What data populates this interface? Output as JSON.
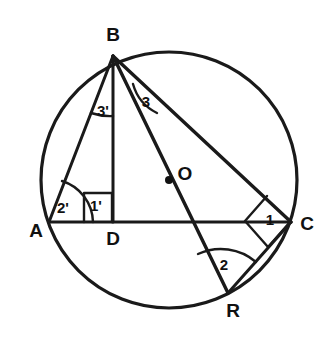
{
  "figure": {
    "type": "circle-geometry-diagram",
    "background_color": "#ffffff",
    "ink_color": "#1a1a1a"
  },
  "circle": {
    "name": "circumscribed-circle",
    "center_label": "O",
    "center_x": 169,
    "center_y": 180,
    "radius": 128,
    "stroke_width": 3.2
  },
  "points": [
    {
      "id": "B",
      "label": "B",
      "x": 113,
      "y": 56,
      "label_x": 113,
      "label_y": 36,
      "on_circle": true
    },
    {
      "id": "A",
      "label": "A",
      "x": 49,
      "y": 222,
      "label_x": 36,
      "label_y": 232,
      "on_circle": true
    },
    {
      "id": "C",
      "label": "C",
      "x": 291,
      "y": 222,
      "label_x": 307,
      "label_y": 225,
      "on_circle": true
    },
    {
      "id": "D",
      "label": "D",
      "x": 113,
      "y": 222,
      "label_x": 113,
      "label_y": 240,
      "on_circle": false
    },
    {
      "id": "R",
      "label": "R",
      "x": 228,
      "y": 293,
      "label_x": 233,
      "label_y": 312,
      "on_circle": true
    },
    {
      "id": "O",
      "label": "O",
      "x": 169,
      "y": 180,
      "label_x": 185,
      "label_y": 175,
      "on_circle": false
    }
  ],
  "segments": [
    {
      "name": "segment-AC",
      "from": "A",
      "to": "C",
      "stroke_width": 3.0
    },
    {
      "name": "segment-AB",
      "from": "A",
      "to": "B",
      "stroke_width": 3.0
    },
    {
      "name": "segment-BD",
      "from": "B",
      "to": "D",
      "stroke_width": 3.0
    },
    {
      "name": "segment-BC",
      "from": "B",
      "to": "C",
      "stroke_width": 3.4
    },
    {
      "name": "segment-BR",
      "from": "B",
      "to": "R",
      "stroke_width": 3.4
    },
    {
      "name": "segment-RC",
      "from": "R",
      "to": "C",
      "stroke_width": 3.0
    }
  ],
  "angle_marks": [
    {
      "name": "angle-3-prime-at-B",
      "label": "3'",
      "vertex": "B",
      "between": [
        "A",
        "D"
      ],
      "marker": "arc",
      "label_x": 103,
      "label_y": 112
    },
    {
      "name": "angle-3-at-B",
      "label": "3",
      "vertex": "B",
      "between": [
        "D",
        "C"
      ],
      "marker": "arc",
      "label_x": 146,
      "label_y": 103
    },
    {
      "name": "angle-2-prime-at-A",
      "label": "2'",
      "vertex": "A",
      "between": [
        "B",
        "C"
      ],
      "marker": "arc",
      "label_x": 63,
      "label_y": 209
    },
    {
      "name": "angle-1-prime-at-D",
      "label": "1'",
      "vertex": "D",
      "between": [
        "A",
        "B"
      ],
      "marker": "right-angle-square",
      "label_x": 96,
      "label_y": 207
    },
    {
      "name": "angle-1-at-C",
      "label": "1",
      "vertex": "C",
      "between": [
        "B",
        "R"
      ],
      "marker": "right-angle-square",
      "label_x": 270,
      "label_y": 221
    },
    {
      "name": "angle-2-at-R",
      "label": "2",
      "vertex": "R",
      "between": [
        "B",
        "C"
      ],
      "marker": "arc",
      "label_x": 224,
      "label_y": 266
    }
  ]
}
